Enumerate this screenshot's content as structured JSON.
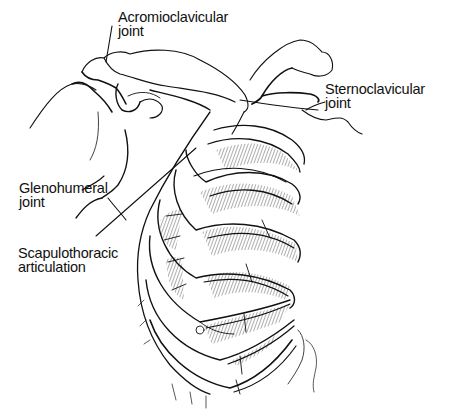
{
  "diagram": {
    "style": "black-and-white anatomical line drawing",
    "colors": {
      "ink": "#111111",
      "background": "#ffffff",
      "hatch": "#333333"
    },
    "labels": [
      {
        "id": "acromioclavicular",
        "line1": "Acromioclavicular",
        "line2": "joint"
      },
      {
        "id": "sternoclavicular",
        "line1": "Sternoclavicular",
        "line2": "joint"
      },
      {
        "id": "glenohumeral",
        "line1": "Glenohumeral",
        "line2": "joint"
      },
      {
        "id": "scapulothoracic",
        "line1": "Scapulothoracic",
        "line2": "articulation"
      }
    ]
  }
}
